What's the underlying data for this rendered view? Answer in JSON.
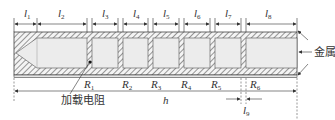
{
  "diagram": {
    "type": "cross-section schematic",
    "top_dimensions": [
      {
        "id": "l1",
        "base": "l",
        "sub": "1"
      },
      {
        "id": "l2",
        "base": "l",
        "sub": "2"
      },
      {
        "id": "l3",
        "base": "l",
        "sub": "3"
      },
      {
        "id": "l4",
        "base": "l",
        "sub": "4"
      },
      {
        "id": "l5",
        "base": "l",
        "sub": "5"
      },
      {
        "id": "l6",
        "base": "l",
        "sub": "6"
      },
      {
        "id": "l7",
        "base": "l",
        "sub": "7"
      },
      {
        "id": "l8",
        "base": "l",
        "sub": "8"
      }
    ],
    "resistors": [
      {
        "base": "R",
        "sub": "1"
      },
      {
        "base": "R",
        "sub": "2"
      },
      {
        "base": "R",
        "sub": "3"
      },
      {
        "base": "R",
        "sub": "4"
      },
      {
        "base": "R",
        "sub": "5"
      },
      {
        "base": "R",
        "sub": "6"
      }
    ],
    "labels": {
      "metal": "金属",
      "load_resistor": "加载电阻",
      "h": "h",
      "l9_base": "l",
      "l9_sub": "9"
    },
    "colors": {
      "hatch": "#555555",
      "cavity": "#ececec",
      "line": "#333333"
    }
  }
}
